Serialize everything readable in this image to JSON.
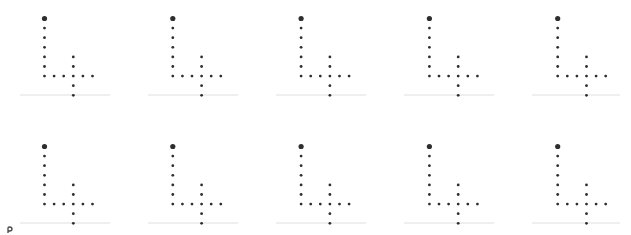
{
  "diagram": {
    "rows": 2,
    "columns": 5,
    "origin": [
      44.5,
      18.5
    ],
    "cell_spacing": [
      128.3,
      128
    ],
    "dot_step": 9.6,
    "dot_color": "#2e2e2e",
    "baseline_color": "#efefef",
    "pattern": {
      "anchor_dot": {
        "dx": 0,
        "dy": 0,
        "r": 2.6
      },
      "dots": [
        [
          0,
          1
        ],
        [
          0,
          2
        ],
        [
          0,
          3
        ],
        [
          0,
          4
        ],
        [
          0,
          5
        ],
        [
          0,
          6
        ],
        [
          1,
          6
        ],
        [
          2,
          6
        ],
        [
          3,
          6
        ],
        [
          4,
          6
        ],
        [
          5,
          6
        ],
        [
          3,
          4
        ],
        [
          3,
          5
        ],
        [
          3,
          7
        ],
        [
          3,
          8
        ]
      ],
      "dot_radius": 1.4
    },
    "baselines": [
      95,
      223
    ]
  },
  "cursor": {
    "icon": "pointer-fragment-icon",
    "color": "#444444"
  }
}
